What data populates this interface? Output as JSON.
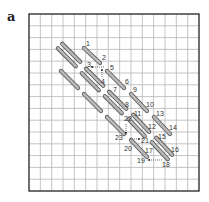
{
  "panel_label": "a",
  "grid": {
    "x": 29,
    "y": 14,
    "width": 170,
    "height": 177,
    "cols": 15,
    "rows": 15,
    "line_color": "#b5b5b5",
    "border_color": "#333333"
  },
  "stitch_style": {
    "fill": "#b9b9b9",
    "stroke": "#555555",
    "width": 4.2
  },
  "stitches": [
    {
      "name": "stitch-double-top-left",
      "x1": 60,
      "y1": 46,
      "x2": 78,
      "y2": 64,
      "double": true
    },
    {
      "name": "stitch-1-2",
      "x1": 84,
      "y1": 48,
      "x2": 100,
      "y2": 63,
      "double": false
    },
    {
      "name": "stitch-single-left",
      "x1": 61,
      "y1": 71,
      "x2": 78,
      "y2": 88,
      "double": false
    },
    {
      "name": "stitch-3-4",
      "x1": 84,
      "y1": 71,
      "x2": 101,
      "y2": 88,
      "double": true
    },
    {
      "name": "stitch-5-6",
      "x1": 107,
      "y1": 71,
      "x2": 124,
      "y2": 88,
      "double": false
    },
    {
      "name": "stitch-single-mid-left",
      "x1": 84,
      "y1": 94,
      "x2": 101,
      "y2": 111,
      "double": false
    },
    {
      "name": "stitch-7-8",
      "x1": 107,
      "y1": 94,
      "x2": 124,
      "y2": 111,
      "double": true
    },
    {
      "name": "stitch-9-10",
      "x1": 131,
      "y1": 94,
      "x2": 147,
      "y2": 111,
      "double": false
    },
    {
      "name": "stitch-single-23",
      "x1": 107,
      "y1": 117,
      "x2": 124,
      "y2": 134,
      "double": false
    },
    {
      "name": "stitch-11-12",
      "x1": 131,
      "y1": 117,
      "x2": 147,
      "y2": 134,
      "double": true
    },
    {
      "name": "stitch-13-14",
      "x1": 154,
      "y1": 117,
      "x2": 170,
      "y2": 134,
      "double": false
    },
    {
      "name": "stitch-20-17",
      "x1": 131,
      "y1": 140,
      "x2": 147,
      "y2": 157,
      "double": false
    },
    {
      "name": "stitch-15-16",
      "x1": 154,
      "y1": 140,
      "x2": 170,
      "y2": 157,
      "double": true
    }
  ],
  "labels": [
    {
      "text": "1",
      "x": 86,
      "y": 46
    },
    {
      "text": "2",
      "x": 102,
      "y": 60
    },
    {
      "text": "3",
      "x": 87,
      "y": 67
    },
    {
      "text": "4",
      "x": 101,
      "y": 84
    },
    {
      "text": "5",
      "x": 110,
      "y": 70
    },
    {
      "text": "6",
      "x": 125,
      "y": 84
    },
    {
      "text": "7",
      "x": 113,
      "y": 92
    },
    {
      "text": "8",
      "x": 125,
      "y": 107
    },
    {
      "text": "9",
      "x": 133,
      "y": 92
    },
    {
      "text": "10",
      "x": 146,
      "y": 107
    },
    {
      "text": "11",
      "x": 134,
      "y": 116
    },
    {
      "text": "12",
      "x": 148,
      "y": 129
    },
    {
      "text": "13",
      "x": 156,
      "y": 116
    },
    {
      "text": "14",
      "x": 169,
      "y": 130
    },
    {
      "text": "15",
      "x": 158,
      "y": 139
    },
    {
      "text": "16",
      "x": 171,
      "y": 152
    },
    {
      "text": "17",
      "x": 145,
      "y": 153
    },
    {
      "text": "18",
      "x": 162,
      "y": 167
    },
    {
      "text": "19",
      "x": 137,
      "y": 163
    },
    {
      "text": "20",
      "x": 124,
      "y": 151
    },
    {
      "text": "21",
      "x": 141,
      "y": 143
    },
    {
      "text": "22",
      "x": 124,
      "y": 121
    },
    {
      "text": "23",
      "x": 115,
      "y": 140
    }
  ],
  "arrows": [
    {
      "name": "arrow-2-to-3",
      "x1": 104,
      "y1": 67,
      "x2": 91,
      "y2": 67
    },
    {
      "name": "arrow-4-up",
      "x1": 102,
      "y1": 77,
      "x2": 102,
      "y2": 69
    },
    {
      "name": "arrow-22-to-23",
      "x1": 126,
      "y1": 124,
      "x2": 126,
      "y2": 134
    },
    {
      "name": "arrow-to-21",
      "x1": 130,
      "y1": 139,
      "x2": 140,
      "y2": 139
    },
    {
      "name": "arrow-18-to-19",
      "x1": 162,
      "y1": 160,
      "x2": 148,
      "y2": 160
    }
  ]
}
